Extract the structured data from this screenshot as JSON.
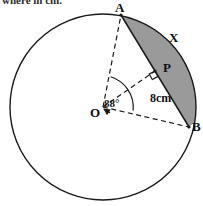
{
  "figure": {
    "clipped_header_text": "where in cm.",
    "labels": {
      "point_a": "A",
      "point_b": "B",
      "point_p": "P",
      "center_o": "O",
      "segment_x": "X",
      "angle": "88°",
      "radius_length": "8cm"
    },
    "colors": {
      "shaded_region": "#9a9a9a",
      "stroke": "#1a1a1a",
      "background": "#ffffff"
    },
    "geometry": {
      "circle": {
        "cx": 103,
        "cy": 107,
        "r": 93
      },
      "point_a": {
        "x": 121,
        "y": 15
      },
      "point_b": {
        "x": 189,
        "y": 127
      },
      "point_p": {
        "x": 155,
        "y": 71
      },
      "central_angle_degrees": 88,
      "radius_label_value": 8,
      "radius_label_unit": "cm",
      "right_angle_at_p": true,
      "dashed_lines": [
        "OA",
        "OP",
        "OB"
      ],
      "shaded_region_type": "circular segment between chord AB and minor arc AB"
    }
  }
}
